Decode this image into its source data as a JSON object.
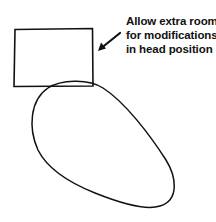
{
  "diagram": {
    "annotation": {
      "lines": [
        "Allow extra room",
        "for modifications",
        "in head position"
      ]
    },
    "shapes": {
      "rectangle": {
        "label": "head-clearance-box",
        "x": 14,
        "y": 29,
        "width": 79,
        "height": 57
      },
      "oval": {
        "label": "head-outline"
      },
      "arrow": {
        "from": [
          120,
          33
        ],
        "to": [
          99,
          50
        ]
      }
    },
    "colors": {
      "stroke": "#111111",
      "background": "#ffffff"
    }
  }
}
